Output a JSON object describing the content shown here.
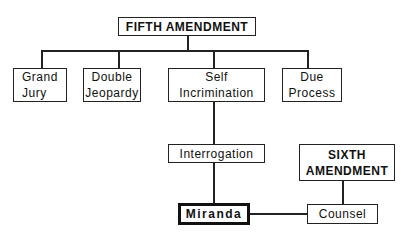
{
  "diagram": {
    "root": "FIFTH AMENDMENT",
    "children": [
      "Grand Jury",
      "Double Jeopardy",
      "Self Incrimination",
      "Due Process"
    ],
    "grand_jury": [
      "Grand",
      "Jury"
    ],
    "double_jeopardy": [
      "Double",
      "Jeopardy"
    ],
    "self_incrimination": [
      "Self",
      "Incrimination"
    ],
    "due_process": [
      "Due",
      "Process"
    ],
    "interrogation": "Interrogation",
    "miranda": "Miranda",
    "sixth": [
      "SIXTH",
      "AMENDMENT"
    ],
    "counsel": "Counsel"
  }
}
